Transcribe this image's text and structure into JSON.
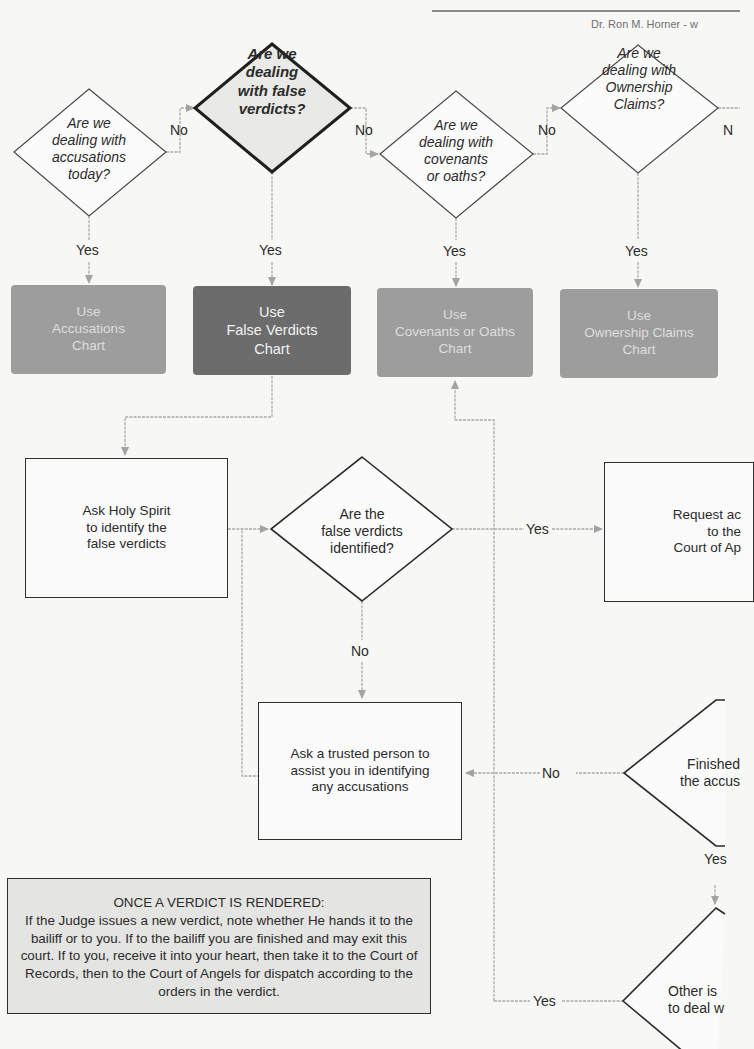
{
  "header": {
    "author": "Dr. Ron M. Horner - w"
  },
  "decisions": {
    "accusations": "Are we\ndealing with\naccusations\ntoday?",
    "false_verdicts": "Are we\ndealing\nwith false\nverdicts?",
    "covenants": "Are we\ndealing with\ncovenants\nor oaths?",
    "ownership": "Are we\ndealing with\nOwnership\nClaims?",
    "identified": "Are the\nfalse verdicts\nidentified?",
    "finished": "Finished\nthe accus",
    "other_issues": "Other is\nto deal w"
  },
  "charts": {
    "accusations": "Use\nAccusations\nChart",
    "false_verdicts": "Use\nFalse Verdicts\nChart",
    "covenants": "Use\nCovenants or Oaths\nChart",
    "ownership": "Use\nOwnership Claims\nChart"
  },
  "processes": {
    "ask_holy_spirit": "Ask Holy Spirit\nto identify the\nfalse verdicts",
    "request_access": "Request ac\nto the\nCourt of Ap",
    "ask_trusted_person": "Ask a trusted person to\nassist you in identifying\nany accusations"
  },
  "edge_labels": {
    "no_1": "No",
    "no_2": "No",
    "no_3": "No",
    "no_4": "N",
    "yes_1": "Yes",
    "yes_2": "Yes",
    "yes_3": "Yes",
    "yes_4": "Yes",
    "yes_identified": "Yes",
    "no_identified": "No",
    "no_finished": "No",
    "yes_finished": "Yes",
    "yes_other": "Yes"
  },
  "note": {
    "title": "ONCE A VERDICT IS RENDERED:",
    "body": "If the Judge issues a new verdict, note whether He hands it to the bailiff or to you. If to the bailiff you are finished and may exit this court. If to you, receive it into your heart, then take it to the Court of Records, then to the Court of Angels for dispatch according to the orders in the verdict."
  },
  "colors": {
    "background": "#f7f7f5",
    "chart_light": "#9d9d9d",
    "chart_dark": "#6c6c6c",
    "connector": "#a8a8a8",
    "outline": "#2f2f2f"
  }
}
